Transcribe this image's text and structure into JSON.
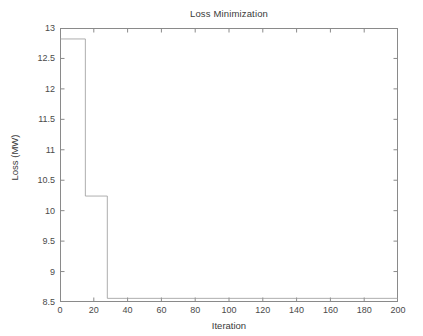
{
  "chart_data": {
    "type": "line",
    "title": "Loss Minimization",
    "xlabel": "Iteration",
    "ylabel": "Loss (MW)",
    "xlim": [
      0,
      200
    ],
    "ylim": [
      8.5,
      13
    ],
    "xticks": [
      0,
      20,
      40,
      60,
      80,
      100,
      120,
      140,
      160,
      180,
      200
    ],
    "yticks": [
      8.5,
      9,
      9.5,
      10,
      10.5,
      11,
      11.5,
      12,
      12.5,
      13
    ],
    "xtick_labels": [
      "0",
      "20",
      "40",
      "60",
      "80",
      "100",
      "120",
      "140",
      "160",
      "180",
      "200"
    ],
    "ytick_labels": [
      "8.5",
      "9",
      "9.5",
      "10",
      "10.5",
      "11",
      "11.5",
      "12",
      "12.5",
      "13"
    ],
    "grid": false,
    "legend": null,
    "series": [
      {
        "name": "Loss",
        "style": "step-post",
        "color": "#999999",
        "linewidth": 0.8,
        "x": [
          0,
          15,
          15,
          28,
          28,
          200
        ],
        "y": [
          12.82,
          12.82,
          10.24,
          10.24,
          8.56,
          8.56
        ],
        "points": [
          {
            "x": 0,
            "y": 12.82
          },
          {
            "x": 15,
            "y": 12.82
          },
          {
            "x": 15,
            "y": 10.24
          },
          {
            "x": 28,
            "y": 10.24
          },
          {
            "x": 28,
            "y": 8.56
          },
          {
            "x": 200,
            "y": 8.56
          }
        ]
      }
    ],
    "annotations": []
  },
  "figure": {
    "background_color": "#ffffff",
    "axes_color": "#8a8a8a",
    "text_color": "#3a3a3a",
    "box": true,
    "tick_direction": "in"
  }
}
